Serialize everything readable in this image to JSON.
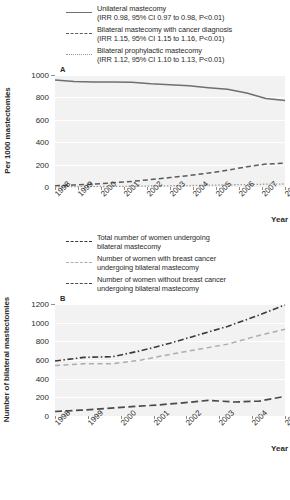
{
  "figure": {
    "panel_a_letter": "A",
    "panel_b_letter": "B"
  },
  "legend_a": {
    "items": [
      {
        "style": "solid",
        "line1": "Unilateral mastecomy",
        "line2": "(IRR 0.98, 95% CI 0.97 to 0.98, P<0.01)"
      },
      {
        "style": "dashed",
        "line1": "Bilateral mastecomy with cancer diagnosis",
        "line2": "(IRR 1.15, 95% CI 1.15 to 1.16, P<0.01)"
      },
      {
        "style": "dotted",
        "line1": "Bilateral prophylactic mastecomy",
        "line2": "(IRR 1.12, 95% CI 1.10 to 1.13, P<0.01)"
      }
    ]
  },
  "legend_b": {
    "items": [
      {
        "style": "dash-dot",
        "line1": "Total number of women undergoing",
        "line2": "bilateral mastecomy"
      },
      {
        "style": "dashed-light",
        "line1": "Number of women with breast cancer",
        "line2": "undergoing bilateral mastecomy"
      },
      {
        "style": "dashed-dark",
        "line1": "Number of women without breast cancer",
        "line2": "undergoing bilateral mastecomy"
      }
    ]
  },
  "chart_data": [
    {
      "id": "panel-a",
      "panel": "A",
      "type": "line",
      "title": "",
      "xlabel": "Year",
      "ylabel": "Per 1000 mastectomies",
      "categories": [
        "1998",
        "1999",
        "2000",
        "2001",
        "2002",
        "2003",
        "2004",
        "2005",
        "2006",
        "2007",
        "2008"
      ],
      "xlim": [
        1998,
        2008
      ],
      "ylim": [
        0,
        1000
      ],
      "yticks": [
        0,
        200,
        400,
        600,
        800,
        1000
      ],
      "grid": true,
      "legend_position": "above",
      "series": [
        {
          "name": "Unilateral mastecomy",
          "style": "solid",
          "color": "#6f6f6f",
          "values": [
            955,
            941,
            938,
            938,
            936,
            921,
            914,
            903,
            886,
            872,
            840,
            790,
            772
          ]
        },
        {
          "name": "Bilateral mastecomy with cancer diagnosis",
          "style": "dashed",
          "color": "#5b5b5b",
          "values": [
            11,
            18,
            26,
            37,
            50,
            66,
            84,
            103,
            124,
            150,
            180,
            205,
            212
          ]
        },
        {
          "name": "Bilateral prophylactic mastecomy",
          "style": "dotted",
          "color": "#9a9a9a",
          "values": [
            2,
            3,
            4,
            5,
            7,
            9,
            11,
            13,
            16,
            19,
            22,
            25,
            27
          ]
        }
      ]
    },
    {
      "id": "panel-b",
      "panel": "B",
      "type": "line",
      "title": "",
      "xlabel": "Year",
      "ylabel": "Number of bilateral mastectomies",
      "categories": [
        "1998",
        "1999",
        "2000",
        "2001",
        "2002",
        "2003",
        "2004",
        "2005"
      ],
      "xlim": [
        1998,
        2005
      ],
      "ylim": [
        0,
        1200
      ],
      "yticks": [
        0,
        200,
        400,
        600,
        800,
        1000,
        1200
      ],
      "grid": true,
      "legend_position": "above",
      "series": [
        {
          "name": "Total number of women undergoing bilateral mastecomy",
          "style": "dash-dot",
          "color": "#3a3a3a",
          "values": [
            590,
            628,
            636,
            700,
            780,
            870,
            960,
            1070,
            1190
          ]
        },
        {
          "name": "Number of women with breast cancer undergoing bilateral mastecomy",
          "style": "dashed-light",
          "color": "#adadad",
          "values": [
            540,
            560,
            560,
            600,
            660,
            715,
            770,
            855,
            930
          ]
        },
        {
          "name": "Number of women without breast cancer undergoing bilateral mastecomy",
          "style": "dashed-dark",
          "color": "#4a4a4a",
          "values": [
            48,
            62,
            80,
            100,
            118,
            140,
            168,
            150,
            160,
            210
          ]
        }
      ]
    }
  ]
}
